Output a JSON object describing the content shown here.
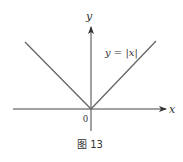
{
  "diagram": {
    "type": "function-graph",
    "function_label": "y = |x|",
    "x_axis_label": "x",
    "y_axis_label": "y",
    "origin_label": "0",
    "caption": "图 13",
    "colors": {
      "axis": "#333333",
      "curve": "#555555",
      "text": "#333333"
    }
  }
}
